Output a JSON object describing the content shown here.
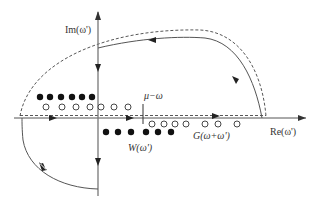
{
  "diagram": {
    "type": "contour-integration-complex-plane",
    "axes": {
      "imag_label": "Im(ω')",
      "real_label": "Re(ω')"
    },
    "markers": {
      "mu_minus_omega_label": "μ−ω"
    },
    "pole_labels": {
      "W": "W(ω')",
      "G": "G(ω+ω')"
    },
    "poles": {
      "filled_upper": [
        [
          40,
          97
        ],
        [
          50,
          97
        ],
        [
          61,
          97
        ],
        [
          72,
          97
        ],
        [
          82,
          97
        ],
        [
          92,
          97
        ]
      ],
      "open_upper": [
        [
          46,
          107
        ],
        [
          62,
          107
        ],
        [
          76,
          107
        ],
        [
          90,
          107
        ],
        [
          100,
          107
        ],
        [
          113,
          107
        ],
        [
          127,
          107
        ]
      ],
      "filled_lower": [
        [
          106,
          132
        ],
        [
          118,
          132
        ],
        [
          131,
          132
        ],
        [
          146,
          132
        ],
        [
          158,
          132
        ],
        [
          171,
          132
        ]
      ],
      "open_lower": [
        [
          152,
          124
        ],
        [
          164,
          124
        ],
        [
          175,
          124
        ],
        [
          186,
          124
        ],
        [
          205,
          124
        ],
        [
          218,
          124
        ],
        [
          237,
          124
        ]
      ]
    },
    "colors": {
      "line": "#555555",
      "pole": "#111111",
      "background": "#ffffff"
    }
  }
}
